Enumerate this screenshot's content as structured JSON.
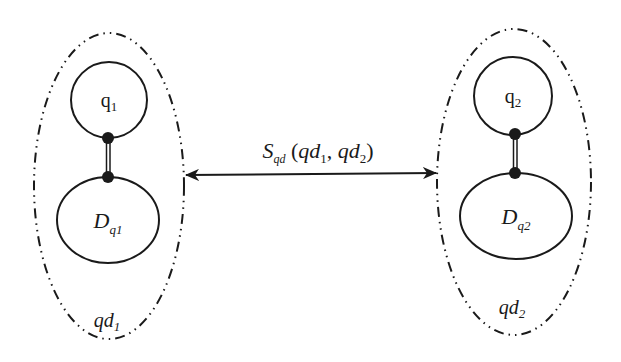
{
  "diagram": {
    "colors": {
      "stroke": "#1a1a1a",
      "background": "#ffffff"
    },
    "groups": [
      {
        "id": "qd1",
        "label_main": "qd",
        "label_sub": "1",
        "query": {
          "main": "q",
          "sub": "1"
        },
        "document": {
          "main": "D",
          "sub": "q1"
        }
      },
      {
        "id": "qd2",
        "label_main": "qd",
        "label_sub": "2",
        "query": {
          "main": "q",
          "sub": "2"
        },
        "document": {
          "main": "D",
          "sub": "q2"
        }
      }
    ],
    "relation": {
      "main": "S",
      "sub": "qd",
      "open": " (",
      "arg1_main": "qd",
      "arg1_sub": "1",
      "comma": ", ",
      "arg2_main": "qd",
      "arg2_sub": "2",
      "close": ")",
      "direction": "bidirectional"
    }
  }
}
